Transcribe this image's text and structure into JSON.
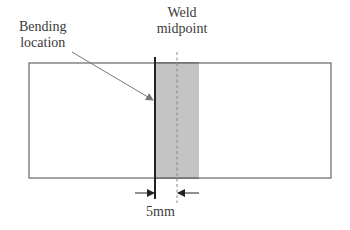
{
  "diagram": {
    "labels": {
      "bending_line1": "Bending",
      "bending_line2": "location",
      "weld_line1": "Weld",
      "weld_line2": "midpoint",
      "dimension": "5mm"
    },
    "colors": {
      "outline": "#555555",
      "bend_line": "#222222",
      "weld_fill": "#c4c4c4",
      "dashed": "#888888",
      "arrow": "#777777",
      "text": "#3a3a3a"
    },
    "geometry": {
      "plate": {
        "x": 29,
        "y": 63,
        "width": 302,
        "height": 115
      },
      "weld_zone": {
        "x": 155,
        "y": 63,
        "width": 44,
        "height": 115
      },
      "bend_line_x": 155,
      "midpoint_x": 177
    }
  }
}
